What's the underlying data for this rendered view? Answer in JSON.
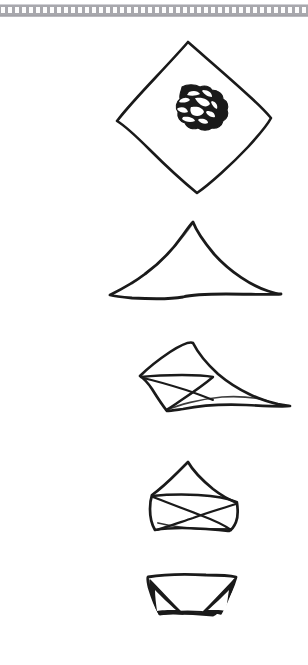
{
  "document": {
    "kind": "scanned-hand-drawn-diagram",
    "subject": "cloth folding instruction sequence",
    "background_color": "#ffffff",
    "ink_color": "#1a1a1a"
  },
  "top_strip": {
    "name": "perforated-film-strip-border",
    "band_color": "#a8a8ad",
    "perforation_color": "#fdfdfd",
    "perforation_count": 52
  },
  "panels": [
    {
      "index": 1,
      "name": "open-square-with-bundle",
      "description": "Square cloth laid flat as a diamond with a crumpled bundle in the centre",
      "shape": "diamond",
      "has_center_bundle": true,
      "vertices": {
        "top": [
          188,
          42
        ],
        "right": [
          270,
          118
        ],
        "bottom": [
          196,
          192
        ],
        "left": [
          116,
          122
        ]
      }
    },
    {
      "index": 2,
      "name": "folded-triangle",
      "description": "Diamond folded in half into a wide triangle",
      "shape": "triangle",
      "has_center_bundle": false,
      "vertices": {
        "apex": [
          193,
          222
        ],
        "left": [
          118,
          295
        ],
        "right": [
          280,
          292
        ]
      }
    },
    {
      "index": 3,
      "name": "left-corner-folded-in",
      "description": "Triangle with its left corner folded inward toward the centre",
      "shape": "triangle-with-fold",
      "has_center_bundle": false,
      "vertices": {
        "apex": [
          193,
          343
        ],
        "left": [
          155,
          377
        ],
        "bottom": [
          173,
          410
        ],
        "right_tip": [
          285,
          405
        ]
      }
    },
    {
      "index": 4,
      "name": "both-corners-folded-in",
      "description": "Both side corners folded in, forming a compact pentagonal pouch",
      "shape": "pentagon-pouch",
      "has_center_bundle": false,
      "vertices": {
        "apex": [
          188,
          462
        ],
        "left": [
          155,
          495
        ],
        "right": [
          237,
          497
        ],
        "bottom_left": [
          168,
          527
        ],
        "bottom_right": [
          228,
          525
        ]
      }
    },
    {
      "index": 5,
      "name": "finished-pouch",
      "description": "Finished trapezoidal pouch with two dark tucked corner wings",
      "shape": "trapezoid-pouch",
      "has_center_bundle": false,
      "vertices": {
        "top_left": [
          148,
          577
        ],
        "top_right": [
          233,
          577
        ],
        "bottom_right": [
          218,
          612
        ],
        "bottom_left": [
          161,
          612
        ]
      }
    }
  ]
}
